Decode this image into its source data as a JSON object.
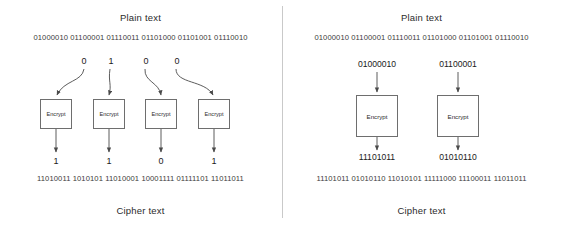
{
  "figure": {
    "type": "diagram",
    "panel_count": 2
  },
  "left_panel": {
    "name": "stream-cipher",
    "header_top": "Plain text",
    "header_bottom": "Cipher text",
    "plain_text_bits": "01000010 01100001 01110011 01101000 01101001 01110010",
    "cipher_text_bits": "11010011 1010101 11010001 10001111 01111101 11011011",
    "encrypt_label": "Encrypt",
    "units": [
      {
        "input_bit": "0",
        "output_bit": "1",
        "box_label": "Encrypt"
      },
      {
        "input_bit": "1",
        "output_bit": "1",
        "box_label": "Encrypt"
      },
      {
        "input_bit": "0",
        "output_bit": "0",
        "box_label": "Encrypt"
      },
      {
        "input_bit": "0",
        "output_bit": "1",
        "box_label": "Encrypt"
      }
    ]
  },
  "right_panel": {
    "name": "block-cipher",
    "header_top": "Plain text",
    "header_bottom": "Cipher text",
    "plain_text_bits": "01000010 01100001 01110011 01101000 01101001 01110010",
    "cipher_text_bits": "11101011 01010110 11010101 11111000 11100011 11011011",
    "encrypt_label": "Encrypt",
    "units": [
      {
        "input_block": "01000010",
        "output_block": "11101011",
        "box_label": "Encrypt"
      },
      {
        "input_block": "01100001",
        "output_block": "01010110",
        "box_label": "Encrypt"
      }
    ]
  },
  "colors": {
    "background": "#ffffff",
    "text": "#1a1a1a",
    "box_border": "#6e6e6e",
    "connector": "#4a4a4a",
    "divider": "#c9c9c9"
  }
}
